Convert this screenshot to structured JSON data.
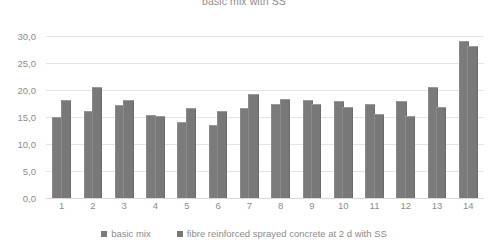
{
  "chart_data": {
    "type": "bar",
    "title": "basic mix with SS",
    "xlabel": "",
    "ylabel": "",
    "ylim": [
      0.0,
      30.0
    ],
    "ytick_step": 5.0,
    "ytick_labels": [
      "30,0",
      "25,0",
      "20,0",
      "15,0",
      "10,0",
      "5,0",
      "0,0"
    ],
    "ytick_values": [
      30.0,
      25.0,
      20.0,
      15.0,
      10.0,
      5.0,
      0.0
    ],
    "grid": true,
    "legend_position": "bottom",
    "categories": [
      "1",
      "2",
      "3",
      "4",
      "5",
      "6",
      "7",
      "8",
      "9",
      "10",
      "11",
      "12",
      "13",
      "14"
    ],
    "series": [
      {
        "name": "basic mix",
        "color": "#7b7b7b",
        "values": [
          14.8,
          16.0,
          17.0,
          15.2,
          13.9,
          13.3,
          16.5,
          17.2,
          18.0,
          17.7,
          17.3,
          17.8,
          20.3,
          28.8
        ]
      },
      {
        "name": "fibre reinforced sprayed concrete at 2 d with SS",
        "color": "#787878",
        "values": [
          18.0,
          20.3,
          18.0,
          15.0,
          16.5,
          16.0,
          19.0,
          18.2,
          17.3,
          16.6,
          15.3,
          15.0,
          16.7,
          28.0
        ]
      }
    ]
  },
  "legend": {
    "items": [
      {
        "label": "basic mix"
      },
      {
        "label": "fibre reinforced sprayed concrete at 2 d with SS"
      }
    ]
  },
  "colors": {
    "bar": "#7b7b7b",
    "grid": "#e4e4e4",
    "text": "#8d8d8d",
    "background": "#ffffff"
  }
}
